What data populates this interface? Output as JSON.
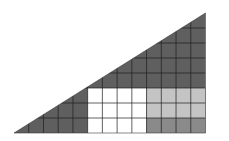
{
  "diagram": {
    "title": "",
    "grid": {
      "columns": 13,
      "rows": 8
    },
    "colors": {
      "triangle_fill": "#5f5f5f",
      "white_region": "#ffffff",
      "light_region": "#c4c4c4",
      "medium_region": "#8a8a8a",
      "grid_line": "#1e1e1e",
      "background": "#ffffff"
    },
    "regions": [
      {
        "name": "white-rectangle",
        "col_start": 5,
        "col_end": 9,
        "row_start": 5,
        "row_end": 8,
        "color_key": "white_region"
      },
      {
        "name": "light-gray-rectangle",
        "col_start": 9,
        "col_end": 13,
        "row_start": 5,
        "row_end": 7,
        "color_key": "light_region"
      },
      {
        "name": "medium-gray-strip",
        "col_start": 9,
        "col_end": 13,
        "row_start": 7,
        "row_end": 8,
        "color_key": "medium_region"
      }
    ]
  }
}
